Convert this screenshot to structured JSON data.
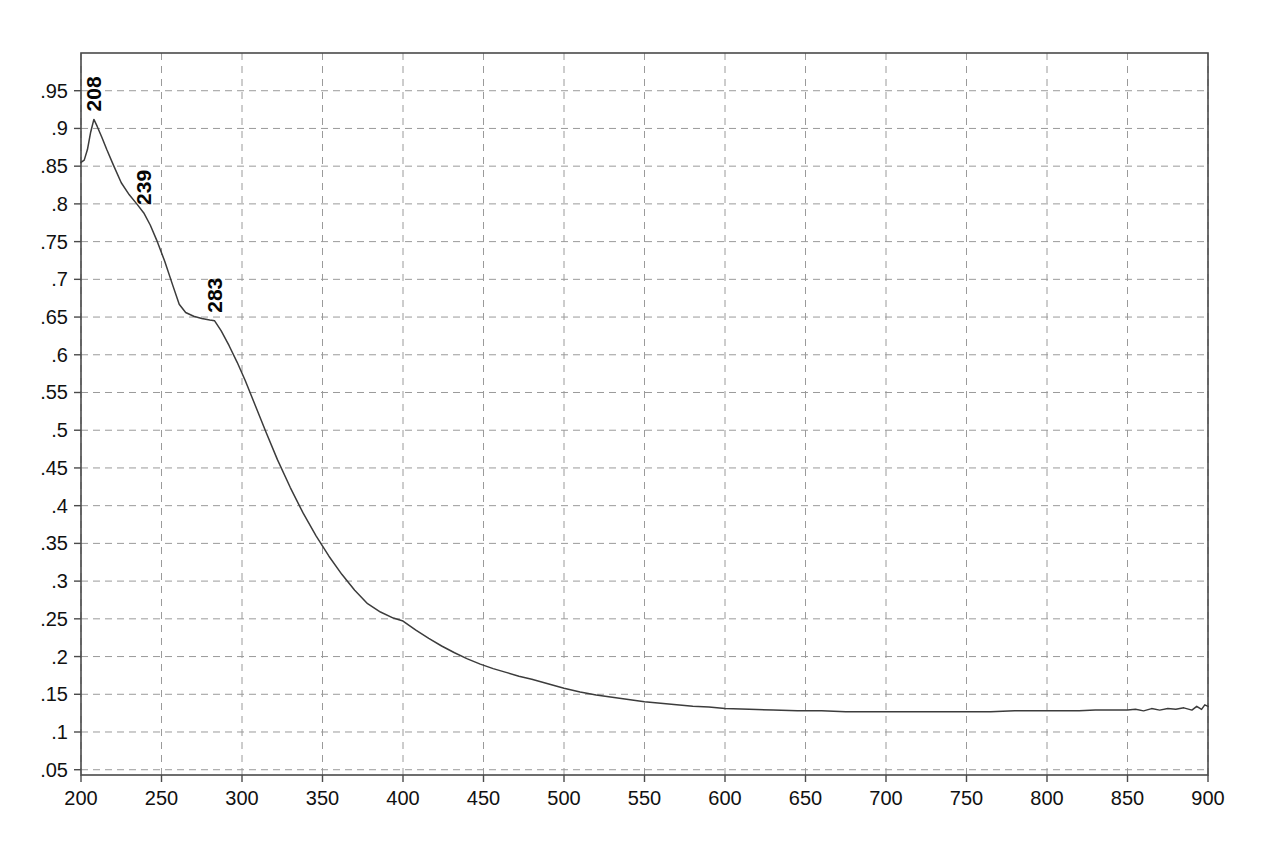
{
  "chart_data": {
    "type": "line",
    "title": "",
    "subtitle": "",
    "xlabel": "",
    "ylabel": "",
    "xlim": [
      200,
      900
    ],
    "ylim": [
      0.043,
      1.0
    ],
    "grid": true,
    "legend": null,
    "xticks": [
      200,
      250,
      300,
      350,
      400,
      450,
      500,
      550,
      600,
      650,
      700,
      750,
      800,
      850,
      900
    ],
    "xtick_labels": [
      "200",
      "250",
      "300",
      "350",
      "400",
      "450",
      "500",
      "550",
      "600",
      "650",
      "700",
      "750",
      "800",
      "850",
      "900"
    ],
    "yticks": [
      0.05,
      0.1,
      0.15,
      0.2,
      0.25,
      0.3,
      0.35,
      0.4,
      0.45,
      0.5,
      0.55,
      0.6,
      0.65,
      0.7,
      0.75,
      0.8,
      0.85,
      0.9,
      0.95
    ],
    "ytick_labels": [
      ".05",
      ".1",
      ".15",
      ".2",
      ".25",
      ".3",
      ".35",
      ".4",
      ".45",
      ".5",
      ".55",
      ".6",
      ".65",
      ".7",
      ".75",
      ".8",
      ".85",
      ".9",
      ".95"
    ],
    "curve_color": "#3c3c3c",
    "grid_color": "#9a9a9a",
    "axis_color": "#4a4a4a",
    "background_color": "#ffffff",
    "annotations": [
      {
        "label": "208",
        "x": 208,
        "y": 0.912,
        "rotation": -90
      },
      {
        "label": "239",
        "x": 239,
        "y": 0.788,
        "rotation": -90
      },
      {
        "label": "283",
        "x": 283,
        "y": 0.645,
        "rotation": -90
      }
    ],
    "series": [
      {
        "name": "spectrum",
        "x": [
          200,
          202,
          204,
          206,
          208,
          210,
          213,
          216,
          220,
          225,
          230,
          235,
          239,
          243,
          247,
          252,
          257,
          261,
          265,
          270,
          275,
          280,
          283,
          287,
          292,
          297,
          302,
          308,
          315,
          322,
          330,
          338,
          346,
          354,
          362,
          370,
          378,
          386,
          394,
          400,
          408,
          416,
          424,
          432,
          440,
          448,
          456,
          464,
          472,
          480,
          490,
          500,
          510,
          520,
          530,
          540,
          550,
          560,
          570,
          580,
          590,
          600,
          615,
          630,
          645,
          660,
          675,
          690,
          705,
          720,
          735,
          750,
          765,
          780,
          795,
          810,
          820,
          830,
          840,
          850,
          855,
          860,
          865,
          870,
          875,
          880,
          885,
          890,
          893,
          896,
          898,
          900
        ],
        "y": [
          0.855,
          0.858,
          0.872,
          0.895,
          0.912,
          0.903,
          0.888,
          0.872,
          0.852,
          0.828,
          0.812,
          0.799,
          0.788,
          0.772,
          0.752,
          0.724,
          0.692,
          0.667,
          0.656,
          0.651,
          0.648,
          0.646,
          0.645,
          0.632,
          0.612,
          0.59,
          0.566,
          0.534,
          0.497,
          0.461,
          0.424,
          0.39,
          0.36,
          0.333,
          0.309,
          0.288,
          0.27,
          0.259,
          0.251,
          0.247,
          0.235,
          0.224,
          0.214,
          0.205,
          0.197,
          0.19,
          0.184,
          0.179,
          0.174,
          0.17,
          0.164,
          0.158,
          0.153,
          0.149,
          0.146,
          0.143,
          0.14,
          0.138,
          0.136,
          0.134,
          0.133,
          0.131,
          0.13,
          0.129,
          0.128,
          0.128,
          0.127,
          0.127,
          0.127,
          0.127,
          0.127,
          0.127,
          0.127,
          0.128,
          0.128,
          0.128,
          0.128,
          0.129,
          0.129,
          0.129,
          0.13,
          0.128,
          0.131,
          0.129,
          0.131,
          0.13,
          0.132,
          0.129,
          0.134,
          0.13,
          0.136,
          0.134
        ]
      }
    ]
  }
}
